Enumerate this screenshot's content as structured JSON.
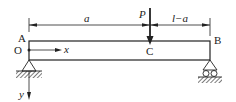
{
  "diagram": {
    "type": "simply-supported-beam",
    "points": {
      "A": "A",
      "B": "B",
      "C": "C",
      "O": "O"
    },
    "load": {
      "label": "P",
      "direction": "down",
      "position": "C"
    },
    "dimensions": {
      "left_segment": "a",
      "right_segment": "l−a"
    },
    "axes": {
      "x": "x",
      "y": "y"
    },
    "supports": {
      "left": "pin",
      "right": "roller"
    },
    "colors": {
      "line": "#222222",
      "background": "#ffffff"
    }
  }
}
